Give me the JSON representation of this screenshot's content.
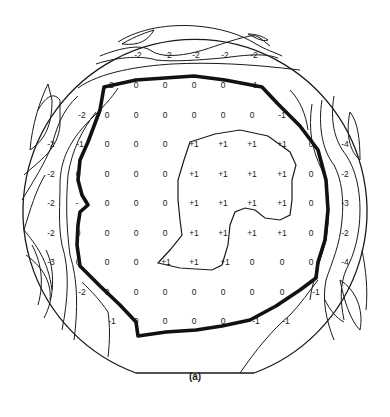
{
  "figure": {
    "caption": "(a)",
    "type": "wafer contour map",
    "colors": {
      "ink": "#1a1a1a",
      "background": "#ffffff"
    }
  },
  "grid": {
    "columns_x": [
      51,
      78,
      107,
      136,
      165,
      194,
      223,
      252,
      282,
      311,
      340
    ],
    "rows_y": [
      55,
      85,
      115,
      144,
      174,
      203,
      233,
      262,
      292,
      321
    ],
    "points": [
      {
        "x": 138,
        "y": 55,
        "v": "-2"
      },
      {
        "x": 168,
        "y": 55,
        "v": "-2"
      },
      {
        "x": 196,
        "y": 55,
        "v": "-2"
      },
      {
        "x": 225,
        "y": 55,
        "v": "-2"
      },
      {
        "x": 254,
        "y": 55,
        "v": "-2"
      },
      {
        "x": 110,
        "y": 85,
        "v": "-2"
      },
      {
        "x": 136,
        "y": 85,
        "v": "0"
      },
      {
        "x": 165,
        "y": 85,
        "v": "0"
      },
      {
        "x": 194,
        "y": 85,
        "v": "0"
      },
      {
        "x": 223,
        "y": 85,
        "v": "0"
      },
      {
        "x": 254,
        "y": 85,
        "v": "-1"
      },
      {
        "x": 82,
        "y": 115,
        "v": "-2"
      },
      {
        "x": 107,
        "y": 115,
        "v": "0"
      },
      {
        "x": 136,
        "y": 115,
        "v": "0"
      },
      {
        "x": 165,
        "y": 115,
        "v": "0"
      },
      {
        "x": 194,
        "y": 115,
        "v": "0"
      },
      {
        "x": 223,
        "y": 115,
        "v": "0"
      },
      {
        "x": 252,
        "y": 115,
        "v": "0"
      },
      {
        "x": 282,
        "y": 115,
        "v": "-1"
      },
      {
        "x": 51,
        "y": 144,
        "v": "-2"
      },
      {
        "x": 80,
        "y": 144,
        "v": "-1"
      },
      {
        "x": 107,
        "y": 144,
        "v": "0"
      },
      {
        "x": 136,
        "y": 144,
        "v": "0"
      },
      {
        "x": 165,
        "y": 144,
        "v": "0"
      },
      {
        "x": 194,
        "y": 144,
        "v": "+1"
      },
      {
        "x": 223,
        "y": 144,
        "v": "+1"
      },
      {
        "x": 252,
        "y": 144,
        "v": "+1"
      },
      {
        "x": 282,
        "y": 144,
        "v": "+1"
      },
      {
        "x": 311,
        "y": 144,
        "v": "0"
      },
      {
        "x": 345,
        "y": 144,
        "v": "-4"
      },
      {
        "x": 51,
        "y": 174,
        "v": "-2"
      },
      {
        "x": 78,
        "y": 174,
        "v": "0"
      },
      {
        "x": 107,
        "y": 174,
        "v": "0"
      },
      {
        "x": 136,
        "y": 174,
        "v": "0"
      },
      {
        "x": 165,
        "y": 174,
        "v": "0"
      },
      {
        "x": 194,
        "y": 174,
        "v": "+1"
      },
      {
        "x": 223,
        "y": 174,
        "v": "+1"
      },
      {
        "x": 252,
        "y": 174,
        "v": "+1"
      },
      {
        "x": 282,
        "y": 174,
        "v": "+1"
      },
      {
        "x": 311,
        "y": 174,
        "v": "0"
      },
      {
        "x": 345,
        "y": 174,
        "v": "-2"
      },
      {
        "x": 51,
        "y": 203,
        "v": "-2"
      },
      {
        "x": 77,
        "y": 203,
        "v": "-"
      },
      {
        "x": 107,
        "y": 203,
        "v": "0"
      },
      {
        "x": 136,
        "y": 203,
        "v": "0"
      },
      {
        "x": 165,
        "y": 203,
        "v": "0"
      },
      {
        "x": 194,
        "y": 203,
        "v": "+1"
      },
      {
        "x": 223,
        "y": 203,
        "v": "+1"
      },
      {
        "x": 252,
        "y": 203,
        "v": "+1"
      },
      {
        "x": 282,
        "y": 203,
        "v": "+1"
      },
      {
        "x": 311,
        "y": 203,
        "v": "0"
      },
      {
        "x": 345,
        "y": 203,
        "v": "-3"
      },
      {
        "x": 51,
        "y": 233,
        "v": "-2"
      },
      {
        "x": 78,
        "y": 233,
        "v": "0"
      },
      {
        "x": 107,
        "y": 233,
        "v": "0"
      },
      {
        "x": 136,
        "y": 233,
        "v": "0"
      },
      {
        "x": 165,
        "y": 233,
        "v": "0"
      },
      {
        "x": 194,
        "y": 233,
        "v": "+1"
      },
      {
        "x": 223,
        "y": 233,
        "v": "+1"
      },
      {
        "x": 252,
        "y": 233,
        "v": "+1"
      },
      {
        "x": 282,
        "y": 233,
        "v": "+1"
      },
      {
        "x": 311,
        "y": 233,
        "v": "0"
      },
      {
        "x": 345,
        "y": 233,
        "v": "-2"
      },
      {
        "x": 51,
        "y": 262,
        "v": "-3"
      },
      {
        "x": 78,
        "y": 262,
        "v": "0"
      },
      {
        "x": 107,
        "y": 262,
        "v": "0"
      },
      {
        "x": 136,
        "y": 262,
        "v": "0"
      },
      {
        "x": 166,
        "y": 262,
        "v": "+1"
      },
      {
        "x": 194,
        "y": 262,
        "v": "+1"
      },
      {
        "x": 225,
        "y": 262,
        "v": "+1"
      },
      {
        "x": 252,
        "y": 262,
        "v": "0"
      },
      {
        "x": 282,
        "y": 262,
        "v": "0"
      },
      {
        "x": 311,
        "y": 262,
        "v": "0"
      },
      {
        "x": 345,
        "y": 262,
        "v": "-4"
      },
      {
        "x": 82,
        "y": 292,
        "v": "-2"
      },
      {
        "x": 107,
        "y": 292,
        "v": "0"
      },
      {
        "x": 136,
        "y": 292,
        "v": "0"
      },
      {
        "x": 165,
        "y": 292,
        "v": "0"
      },
      {
        "x": 194,
        "y": 292,
        "v": "0"
      },
      {
        "x": 223,
        "y": 292,
        "v": "0"
      },
      {
        "x": 252,
        "y": 292,
        "v": "0"
      },
      {
        "x": 282,
        "y": 292,
        "v": "0"
      },
      {
        "x": 316,
        "y": 292,
        "v": "-1"
      },
      {
        "x": 112,
        "y": 321,
        "v": "-1"
      },
      {
        "x": 136,
        "y": 321,
        "v": "0"
      },
      {
        "x": 165,
        "y": 321,
        "v": "0"
      },
      {
        "x": 194,
        "y": 321,
        "v": "0"
      },
      {
        "x": 223,
        "y": 321,
        "v": "0"
      },
      {
        "x": 256,
        "y": 321,
        "v": "-1"
      },
      {
        "x": 286,
        "y": 321,
        "v": "-1"
      }
    ]
  },
  "contours": {
    "zero_boundary": "M104,87 L136,80 L165,78 L194,76 L225,80 L262,87 L278,104 L300,126 L318,150 L326,180 L328,210 L325,240 L318,262 L316,278 L300,290 L276,306 L250,320 L222,326 L196,330 L166,332 L138,336 L136,322 L120,305 L100,286 L80,266 L77,245 L78,225 L80,212 L88,205 L82,195 L78,180 L80,160 L88,142 L100,110 Z",
    "plus_one_region": "M190,142 L215,134 L240,130 L268,136 L290,152 L296,165 L292,180 L292,200 L290,215 L280,220 L265,218 L255,210 L245,208 L235,212 L230,225 L228,245 L222,265 L212,270 L180,268 L158,263 L170,250 L182,235 L180,220 L178,200 L178,180 L184,160 Z"
  }
}
